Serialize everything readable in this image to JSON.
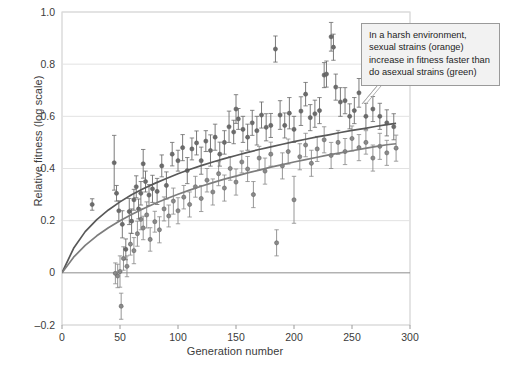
{
  "chart_data": {
    "type": "scatter",
    "title": "",
    "xlabel": "Generation number",
    "ylabel": "Relative fitness (log scale)",
    "xlim": [
      0,
      300
    ],
    "ylim": [
      -0.2,
      1.0
    ],
    "xticks": [
      0,
      50,
      100,
      150,
      200,
      250,
      300
    ],
    "xtick_labels": [
      "0",
      "50",
      "100",
      "150",
      "200",
      "250",
      "300"
    ],
    "yticks": [
      -0.2,
      0,
      0.2,
      0.4,
      0.6,
      0.8,
      1.0
    ],
    "ytick_labels": [
      "-0.2",
      "0",
      "0.2",
      "0.4",
      "0.6",
      "0.8",
      "1.0"
    ],
    "grid": "horizontal",
    "legend_position": "none",
    "series": [
      {
        "name": "sexual strains",
        "color": "#6b6b6b",
        "marker": "circle-with-errorbars",
        "fit_label": "upper fitted curve",
        "fit_points_x": [
          0,
          10,
          20,
          30,
          40,
          50,
          60,
          70,
          80,
          90,
          100,
          110,
          120,
          130,
          140,
          150,
          160,
          170,
          180,
          190,
          200,
          210,
          220,
          230,
          240,
          250,
          260,
          270,
          280,
          288
        ],
        "fit_points_y": [
          0,
          0.094,
          0.158,
          0.204,
          0.241,
          0.272,
          0.299,
          0.322,
          0.343,
          0.362,
          0.38,
          0.396,
          0.411,
          0.425,
          0.438,
          0.45,
          0.462,
          0.473,
          0.483,
          0.493,
          0.503,
          0.512,
          0.521,
          0.529,
          0.538,
          0.546,
          0.553,
          0.561,
          0.568,
          0.573
        ],
        "points": [
          [
            26,
            0.262,
            0.022
          ],
          [
            45,
            0.422,
            0.105
          ],
          [
            47,
            0.305,
            0.03
          ],
          [
            49,
            0.238,
            0.038
          ],
          [
            52,
            0.186,
            0.052
          ],
          [
            55,
            0.09,
            0.04
          ],
          [
            58,
            0.235,
            0.05
          ],
          [
            60,
            0.198,
            0.047
          ],
          [
            62,
            0.28,
            0.04
          ],
          [
            64,
            0.33,
            0.042
          ],
          [
            66,
            0.245,
            0.038
          ],
          [
            68,
            0.305,
            0.045
          ],
          [
            70,
            0.418,
            0.055
          ],
          [
            72,
            0.35,
            0.04
          ],
          [
            75,
            0.298,
            0.04
          ],
          [
            78,
            0.322,
            0.052
          ],
          [
            82,
            0.312,
            0.05
          ],
          [
            86,
            0.41,
            0.042
          ],
          [
            90,
            0.335,
            0.052
          ],
          [
            95,
            0.455,
            0.045
          ],
          [
            100,
            0.43,
            0.04
          ],
          [
            104,
            0.48,
            0.05
          ],
          [
            108,
            0.392,
            0.05
          ],
          [
            112,
            0.475,
            0.042
          ],
          [
            116,
            0.498,
            0.046
          ],
          [
            120,
            0.43,
            0.052
          ],
          [
            124,
            0.505,
            0.04
          ],
          [
            128,
            0.469,
            0.06
          ],
          [
            132,
            0.52,
            0.05
          ],
          [
            136,
            0.455,
            0.046
          ],
          [
            140,
            0.5,
            0.045
          ],
          [
            144,
            0.56,
            0.06
          ],
          [
            148,
            0.54,
            0.045
          ],
          [
            150,
            0.628,
            0.055
          ],
          [
            152,
            0.59,
            0.04
          ],
          [
            156,
            0.55,
            0.05
          ],
          [
            160,
            0.52,
            0.05
          ],
          [
            164,
            0.575,
            0.048
          ],
          [
            168,
            0.545,
            0.055
          ],
          [
            172,
            0.605,
            0.05
          ],
          [
            176,
            0.558,
            0.052
          ],
          [
            180,
            0.565,
            0.046
          ],
          [
            184,
            0.858,
            0.05
          ],
          [
            188,
            0.605,
            0.055
          ],
          [
            192,
            0.565,
            0.048
          ],
          [
            196,
            0.612,
            0.06
          ],
          [
            200,
            0.55,
            0.05
          ],
          [
            206,
            0.62,
            0.055
          ],
          [
            210,
            0.685,
            0.045
          ],
          [
            214,
            0.595,
            0.05
          ],
          [
            218,
            0.61,
            0.052
          ],
          [
            222,
            0.622,
            0.05
          ],
          [
            226,
            0.758,
            0.048
          ],
          [
            228,
            0.762,
            0.05
          ],
          [
            232,
            0.905,
            0.055
          ],
          [
            234,
            0.865,
            0.05
          ],
          [
            236,
            0.712,
            0.05
          ],
          [
            240,
            0.655,
            0.055
          ],
          [
            244,
            0.66,
            0.05
          ],
          [
            248,
            0.6,
            0.048
          ],
          [
            252,
            0.622,
            0.05
          ],
          [
            256,
            0.69,
            0.055
          ],
          [
            262,
            0.6,
            0.05
          ],
          [
            268,
            0.628,
            0.048
          ],
          [
            274,
            0.6,
            0.05
          ],
          [
            280,
            0.575,
            0.05
          ],
          [
            286,
            0.56,
            0.05
          ]
        ]
      },
      {
        "name": "asexual strains",
        "color": "#8a8a8a",
        "marker": "circle-with-errorbars",
        "fit_label": "lower fitted curve",
        "fit_points_x": [
          0,
          10,
          20,
          30,
          40,
          50,
          60,
          70,
          80,
          90,
          100,
          110,
          120,
          130,
          140,
          150,
          160,
          170,
          180,
          190,
          200,
          210,
          220,
          230,
          240,
          250,
          260,
          270,
          280,
          288
        ],
        "fit_points_y": [
          0,
          0.06,
          0.105,
          0.142,
          0.173,
          0.2,
          0.224,
          0.246,
          0.266,
          0.284,
          0.301,
          0.317,
          0.332,
          0.346,
          0.359,
          0.371,
          0.383,
          0.394,
          0.405,
          0.415,
          0.425,
          0.434,
          0.443,
          0.452,
          0.46,
          0.468,
          0.476,
          0.484,
          0.491,
          0.495
        ],
        "points": [
          [
            46,
            -0.002,
            0.04
          ],
          [
            48,
            -0.012,
            0.045
          ],
          [
            50,
            0.005,
            0.06
          ],
          [
            51,
            -0.128,
            0.05
          ],
          [
            53,
            0.055,
            0.045
          ],
          [
            56,
            0.025,
            0.04
          ],
          [
            59,
            0.11,
            0.042
          ],
          [
            62,
            0.085,
            0.05
          ],
          [
            65,
            0.15,
            0.048
          ],
          [
            68,
            0.205,
            0.04
          ],
          [
            70,
            0.172,
            0.045
          ],
          [
            73,
            0.222,
            0.05
          ],
          [
            76,
            0.128,
            0.045
          ],
          [
            80,
            0.196,
            0.04
          ],
          [
            84,
            0.165,
            0.05
          ],
          [
            88,
            0.245,
            0.046
          ],
          [
            92,
            0.218,
            0.042
          ],
          [
            96,
            0.275,
            0.05
          ],
          [
            100,
            0.238,
            0.05
          ],
          [
            105,
            0.29,
            0.045
          ],
          [
            110,
            0.262,
            0.048
          ],
          [
            115,
            0.33,
            0.04
          ],
          [
            120,
            0.285,
            0.05
          ],
          [
            125,
            0.355,
            0.045
          ],
          [
            130,
            0.31,
            0.05
          ],
          [
            135,
            0.38,
            0.046
          ],
          [
            140,
            0.325,
            0.05
          ],
          [
            145,
            0.4,
            0.045
          ],
          [
            150,
            0.348,
            0.05
          ],
          [
            155,
            0.425,
            0.042
          ],
          [
            160,
            0.398,
            0.048
          ],
          [
            165,
            0.3,
            0.05
          ],
          [
            170,
            0.44,
            0.045
          ],
          [
            175,
            0.39,
            0.05
          ],
          [
            180,
            0.455,
            0.046
          ],
          [
            185,
            0.115,
            0.05
          ],
          [
            190,
            0.41,
            0.05
          ],
          [
            195,
            0.465,
            0.048
          ],
          [
            200,
            0.28,
            0.09
          ],
          [
            205,
            0.445,
            0.05
          ],
          [
            210,
            0.49,
            0.045
          ],
          [
            215,
            0.42,
            0.05
          ],
          [
            220,
            0.475,
            0.048
          ],
          [
            226,
            0.51,
            0.05
          ],
          [
            232,
            0.45,
            0.05
          ],
          [
            238,
            0.5,
            0.046
          ],
          [
            244,
            0.465,
            0.05
          ],
          [
            250,
            0.515,
            0.048
          ],
          [
            256,
            0.48,
            0.05
          ],
          [
            262,
            0.5,
            0.045
          ],
          [
            268,
            0.44,
            0.05
          ],
          [
            274,
            0.485,
            0.05
          ],
          [
            280,
            0.46,
            0.048
          ],
          [
            288,
            0.478,
            0.05
          ]
        ]
      }
    ]
  },
  "annotation": {
    "line1": "In a harsh environment,",
    "line2": "sexual strains (orange)",
    "line3": "increase in fitness faster than",
    "line4": "do asexual strains (green)"
  }
}
